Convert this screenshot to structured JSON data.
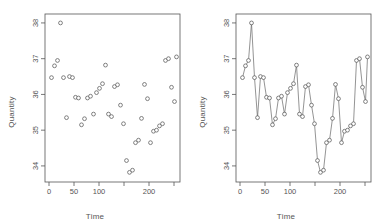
{
  "figure": {
    "background_color": "#ffffff",
    "foreground_color": "#555555",
    "point_color": "#5a5a5a",
    "line_color": "#666666",
    "panel_count": 2
  },
  "panels": [
    {
      "name": "scatter-panel",
      "xlabel": "Time",
      "ylabel": "Quantity",
      "plot_type": "scatter"
    },
    {
      "name": "line-panel",
      "xlabel": "Time",
      "ylabel": "Quantity",
      "plot_type": "line-with-points"
    }
  ],
  "axes": {
    "x_ticks": [
      0,
      50,
      100,
      150,
      200,
      250
    ],
    "x_tick_labels": [
      "0",
      "50",
      "100",
      "",
      "200",
      ""
    ],
    "y_ticks": [
      34,
      35,
      36,
      37,
      38
    ],
    "y_tick_labels": [
      "34",
      "35",
      "36",
      "37",
      "38"
    ],
    "xlim": [
      -8,
      262
    ],
    "ylim": [
      33.55,
      38.25
    ]
  },
  "chart_data": {
    "type": "scatter",
    "title": "",
    "subtitle": "",
    "xlabel": "Time",
    "ylabel": "Quantity",
    "xlim": [
      -8,
      262
    ],
    "ylim": [
      33.55,
      38.25
    ],
    "xticks": [
      0,
      50,
      100,
      150,
      200,
      250
    ],
    "xticklabels": [
      "0",
      "50",
      "100",
      "",
      "200",
      ""
    ],
    "yticks": [
      34,
      35,
      36,
      37,
      38
    ],
    "yticklabels": [
      "34",
      "35",
      "36",
      "37",
      "38"
    ],
    "grid": false,
    "legend": null,
    "legend_position": "none",
    "panels": [
      {
        "label": "left",
        "type": "scatter"
      },
      {
        "label": "right",
        "type": "line"
      }
    ],
    "series": [
      {
        "name": "Quantity",
        "marker": "open-circle",
        "x": [
          5,
          11,
          17,
          23,
          29,
          35,
          41,
          47,
          53,
          59,
          65,
          71,
          77,
          83,
          89,
          95,
          101,
          107,
          113,
          119,
          125,
          131,
          137,
          143,
          149,
          155,
          161,
          167,
          173,
          179,
          185,
          191,
          197,
          203,
          209,
          215,
          221,
          227,
          233,
          239,
          245,
          251,
          255
        ],
        "y": [
          36.47,
          36.8,
          36.95,
          38.0,
          36.47,
          35.35,
          36.5,
          36.47,
          35.92,
          35.9,
          35.15,
          35.32,
          35.9,
          35.95,
          35.45,
          36.05,
          36.17,
          36.3,
          36.82,
          35.45,
          35.38,
          36.22,
          36.27,
          35.7,
          35.18,
          34.15,
          33.82,
          33.88,
          34.65,
          34.72,
          35.33,
          36.28,
          35.88,
          34.65,
          34.97,
          35.0,
          35.12,
          35.18,
          36.95,
          37.0,
          36.2,
          35.8,
          37.05
        ]
      }
    ]
  }
}
